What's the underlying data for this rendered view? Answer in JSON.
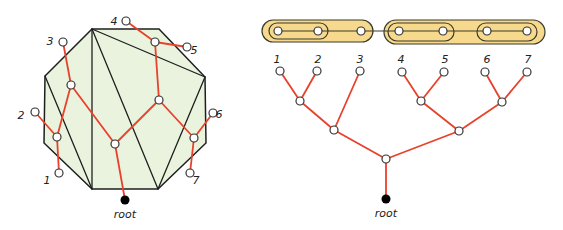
{
  "colors": {
    "polygon_fill": "#e9f3dd",
    "polygon_stroke": "#1f1f1f",
    "tree_edge": "#e8412c",
    "node_fill": "#ffffff",
    "node_stroke": "#333333",
    "root_fill": "#000000",
    "capsule_fill": "#f6d98c",
    "capsule_stroke": "#3a3a2a"
  },
  "left_diagram": {
    "polygon_vertices": [
      [
        92,
        29
      ],
      [
        159,
        29
      ],
      [
        205,
        77
      ],
      [
        206,
        143
      ],
      [
        158,
        189
      ],
      [
        92,
        189
      ],
      [
        44,
        143
      ],
      [
        45,
        76
      ]
    ],
    "diagonals": [
      [
        [
          92,
          29
        ],
        [
          92,
          189
        ]
      ],
      [
        [
          92,
          29
        ],
        [
          158,
          189
        ]
      ],
      [
        [
          92,
          29
        ],
        [
          205,
          77
        ]
      ],
      [
        [
          45,
          76
        ],
        [
          92,
          189
        ]
      ],
      [
        [
          205,
          77
        ],
        [
          158,
          189
        ]
      ]
    ],
    "leaves": [
      {
        "label": "1",
        "x": 59,
        "y": 173,
        "lx": 47,
        "ly": 181
      },
      {
        "label": "2",
        "x": 35,
        "y": 112,
        "lx": 21,
        "ly": 116
      },
      {
        "label": "3",
        "x": 63,
        "y": 42,
        "lx": 50,
        "ly": 42
      },
      {
        "label": "4",
        "x": 126,
        "y": 21,
        "lx": 114,
        "ly": 22
      },
      {
        "label": "5",
        "x": 187,
        "y": 47,
        "lx": 194,
        "ly": 51
      },
      {
        "label": "6",
        "x": 213,
        "y": 113,
        "lx": 219,
        "ly": 115
      },
      {
        "label": "7",
        "x": 190,
        "y": 173,
        "lx": 196,
        "ly": 181
      }
    ],
    "internal_nodes": [
      [
        57,
        137
      ],
      [
        71,
        85
      ],
      [
        115,
        144
      ],
      [
        159,
        100
      ],
      [
        155,
        42
      ],
      [
        194,
        138
      ]
    ],
    "edges": [
      [
        [
          35,
          112
        ],
        [
          57,
          137
        ]
      ],
      [
        [
          59,
          173
        ],
        [
          57,
          137
        ]
      ],
      [
        [
          57,
          137
        ],
        [
          71,
          85
        ]
      ],
      [
        [
          63,
          42
        ],
        [
          71,
          85
        ]
      ],
      [
        [
          71,
          85
        ],
        [
          115,
          144
        ]
      ],
      [
        [
          126,
          21
        ],
        [
          155,
          42
        ]
      ],
      [
        [
          187,
          47
        ],
        [
          155,
          42
        ]
      ],
      [
        [
          155,
          42
        ],
        [
          159,
          100
        ]
      ],
      [
        [
          159,
          100
        ],
        [
          115,
          144
        ]
      ],
      [
        [
          159,
          100
        ],
        [
          194,
          138
        ]
      ],
      [
        [
          213,
          113
        ],
        [
          194,
          138
        ]
      ],
      [
        [
          190,
          173
        ],
        [
          194,
          138
        ]
      ],
      [
        [
          115,
          144
        ],
        [
          125,
          200
        ]
      ]
    ],
    "root": {
      "x": 125,
      "y": 200,
      "label": "root",
      "lx": 125,
      "ly": 215
    }
  },
  "right_diagram": {
    "capsules": [
      {
        "x": 262,
        "y": 20,
        "w": 111,
        "h": 22
      },
      {
        "x": 269,
        "y": 23,
        "w": 59,
        "h": 16
      },
      {
        "x": 384,
        "y": 20,
        "w": 161,
        "h": 24
      },
      {
        "x": 388,
        "y": 23,
        "w": 66,
        "h": 18
      },
      {
        "x": 477,
        "y": 23,
        "w": 60,
        "h": 18
      }
    ],
    "chain_line": [
      [
        278,
        31
      ],
      [
        527,
        31
      ]
    ],
    "chain_nodes": [
      [
        278,
        31
      ],
      [
        318,
        31
      ],
      [
        361,
        31
      ],
      [
        399,
        31
      ],
      [
        443,
        31
      ],
      [
        487,
        31
      ],
      [
        527,
        31
      ]
    ],
    "leaves": [
      {
        "label": "1",
        "x": 280,
        "y": 71,
        "lx": 277,
        "ly": 60
      },
      {
        "label": "2",
        "x": 317,
        "y": 71,
        "lx": 318,
        "ly": 60
      },
      {
        "label": "3",
        "x": 360,
        "y": 71,
        "lx": 360,
        "ly": 60
      },
      {
        "label": "4",
        "x": 402,
        "y": 72,
        "lx": 401,
        "ly": 60
      },
      {
        "label": "5",
        "x": 444,
        "y": 72,
        "lx": 445,
        "ly": 60
      },
      {
        "label": "6",
        "x": 485,
        "y": 72,
        "lx": 487,
        "ly": 60
      },
      {
        "label": "7",
        "x": 527,
        "y": 72,
        "lx": 528,
        "ly": 60
      }
    ],
    "internal_nodes": [
      [
        300,
        101
      ],
      [
        334,
        130
      ],
      [
        421,
        101
      ],
      [
        502,
        102
      ],
      [
        459,
        131
      ],
      [
        386,
        159
      ]
    ],
    "edges": [
      [
        [
          280,
          71
        ],
        [
          300,
          101
        ]
      ],
      [
        [
          317,
          71
        ],
        [
          300,
          101
        ]
      ],
      [
        [
          300,
          101
        ],
        [
          334,
          130
        ]
      ],
      [
        [
          360,
          71
        ],
        [
          334,
          130
        ]
      ],
      [
        [
          334,
          130
        ],
        [
          386,
          159
        ]
      ],
      [
        [
          402,
          72
        ],
        [
          421,
          101
        ]
      ],
      [
        [
          444,
          72
        ],
        [
          421,
          101
        ]
      ],
      [
        [
          485,
          72
        ],
        [
          502,
          102
        ]
      ],
      [
        [
          527,
          72
        ],
        [
          502,
          102
        ]
      ],
      [
        [
          421,
          101
        ],
        [
          459,
          131
        ]
      ],
      [
        [
          502,
          102
        ],
        [
          459,
          131
        ]
      ],
      [
        [
          459,
          131
        ],
        [
          386,
          159
        ]
      ],
      [
        [
          386,
          159
        ],
        [
          386,
          199
        ]
      ]
    ],
    "root": {
      "x": 386,
      "y": 199,
      "label": "root",
      "lx": 386,
      "ly": 214
    }
  }
}
